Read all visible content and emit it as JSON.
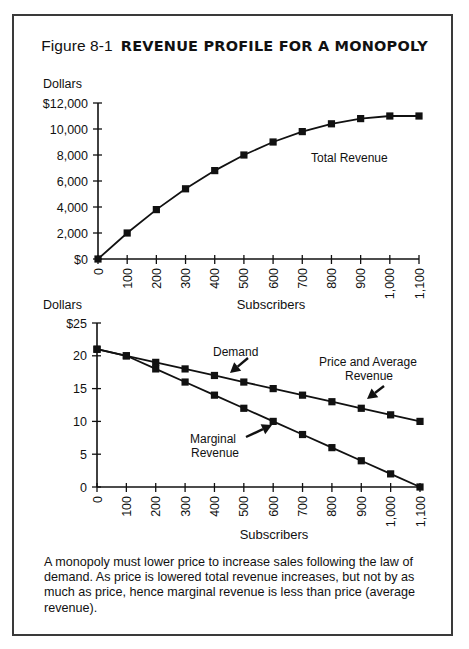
{
  "figure": {
    "number": "Figure 8-1",
    "title": "REVENUE PROFILE FOR A MONOPOLY"
  },
  "caption": "A monopoly must lower price to increase sales following the law of demand.  As price is lowered total revenue increases, but not by as much as price, hence marginal  revenue is less than price (average revenue).",
  "colors": {
    "ink": "#111111",
    "frame": "#3a3a3a",
    "background": "#ffffff"
  },
  "chart_data": [
    {
      "type": "line",
      "title": "Total Revenue",
      "xlabel": "Subscribers",
      "ylabel": "Dollars",
      "x": [
        0,
        100,
        200,
        300,
        400,
        500,
        600,
        700,
        800,
        900,
        1000,
        1100
      ],
      "x_tick_labels": [
        "0",
        "100",
        "200",
        "300",
        "400",
        "500",
        "600",
        "700",
        "800",
        "900",
        "1,000",
        "1,100"
      ],
      "y_ticks": [
        0,
        2000,
        4000,
        6000,
        8000,
        10000,
        12000
      ],
      "y_tick_labels": [
        "$0",
        "2,000",
        "4,000",
        "6,000",
        "8,000",
        "10,000",
        "$12,000"
      ],
      "ylim": [
        0,
        12000
      ],
      "xlim": [
        0,
        1100
      ],
      "grid": false,
      "series": [
        {
          "name": "Total Revenue",
          "marker": "square",
          "values": [
            0,
            2000,
            3800,
            5400,
            6800,
            8000,
            9000,
            9800,
            10400,
            10800,
            11000,
            11000
          ]
        }
      ],
      "annotations": [
        {
          "text": "Total Revenue",
          "x": 311,
          "y": 162
        }
      ]
    },
    {
      "type": "line",
      "title": "Demand and Marginal Revenue",
      "xlabel": "Subscribers",
      "ylabel": "Dollars",
      "x": [
        0,
        100,
        200,
        300,
        400,
        500,
        600,
        700,
        800,
        900,
        1000,
        1100
      ],
      "x_tick_labels": [
        "0",
        "100",
        "200",
        "300",
        "400",
        "500",
        "600",
        "700",
        "800",
        "900",
        "1,000",
        "1,100"
      ],
      "y_ticks": [
        0,
        5,
        10,
        15,
        20,
        25
      ],
      "y_tick_labels": [
        "0",
        "5",
        "10",
        "15",
        "20",
        "$25"
      ],
      "ylim": [
        0,
        25
      ],
      "xlim": [
        0,
        1100
      ],
      "grid": false,
      "series": [
        {
          "name": "Demand (Price and Average Revenue)",
          "marker": "square",
          "values": [
            21,
            20,
            19,
            18,
            17,
            16,
            15,
            14,
            13,
            12,
            11,
            10
          ]
        },
        {
          "name": "Marginal Revenue",
          "marker": "square",
          "values": [
            21,
            20,
            18,
            16,
            14,
            12,
            10,
            8,
            6,
            4,
            2,
            0
          ]
        }
      ],
      "annotations": [
        {
          "text": "Demand",
          "x": 213,
          "y": 356,
          "arrow": [
            248,
            358,
            230,
            373
          ]
        },
        {
          "text": "Price and Average",
          "x": 319,
          "y": 366,
          "arrow": null
        },
        {
          "text": "Revenue",
          "x": 345,
          "y": 380,
          "arrow": [
            384,
            386,
            367,
            399
          ]
        },
        {
          "text": "Marginal",
          "x": 190,
          "y": 443,
          "arrow": [
            246,
            437,
            272,
            425
          ]
        },
        {
          "text": "Revenue",
          "x": 191,
          "y": 457,
          "arrow": null
        }
      ]
    }
  ]
}
